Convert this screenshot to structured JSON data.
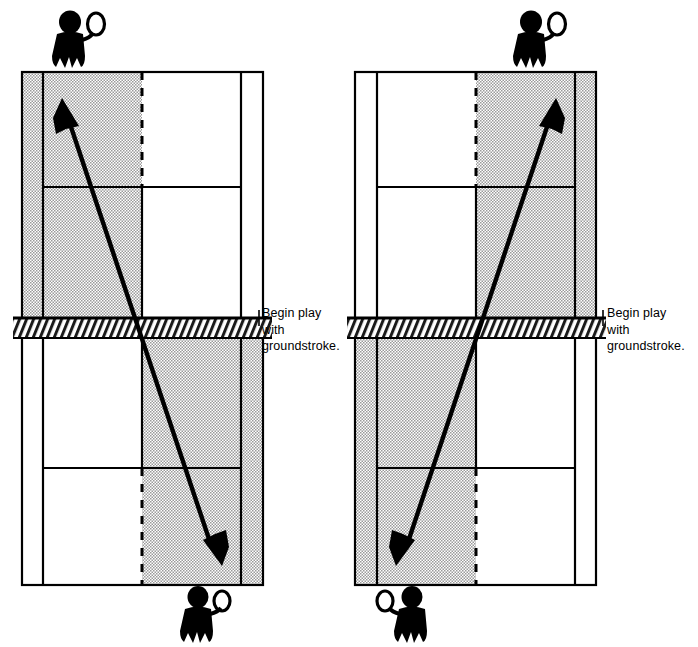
{
  "figure": {
    "type": "diagram",
    "background_color": "#ffffff",
    "ink_color": "#000000",
    "shade_color": "#d0d0d0"
  },
  "panels": [
    {
      "id": "left",
      "name": "crosscourt-drill",
      "caption": "Begin play\nwith\ngroundstroke.",
      "shaded_zone_top": "deuce-side-left-half",
      "shaded_zone_bottom": "ad-side-right-half",
      "players": [
        {
          "name": "player-top",
          "position": "top-left-of-baseline",
          "racquet_side": "right"
        },
        {
          "name": "player-bottom",
          "position": "bottom-center-right-of-baseline",
          "racquet_side": "right"
        }
      ],
      "ball_path": {
        "name": "crosscourt-rally-line",
        "from": "bottom-right-shaded-zone",
        "to": "top-left-shaded-zone",
        "arrowheads": [
          "top-end",
          "bottom-end"
        ],
        "crosses_net_at": "center"
      }
    },
    {
      "id": "right",
      "name": "down-the-line-drill",
      "caption": "Begin play\nwith\ngroundstroke.",
      "shaded_zone_top": "right-half",
      "shaded_zone_bottom": "left-half",
      "players": [
        {
          "name": "player-top",
          "position": "top-right-of-baseline",
          "racquet_side": "right"
        },
        {
          "name": "player-bottom",
          "position": "bottom-left-of-baseline",
          "racquet_side": "left"
        }
      ],
      "ball_path": {
        "name": "crosscourt-rally-line",
        "from": "bottom-left-shaded-zone",
        "to": "top-right-shaded-zone",
        "arrowheads": [
          "top-end",
          "bottom-end"
        ],
        "crosses_net_at": "center"
      }
    }
  ],
  "court": {
    "lines": [
      "baseline-top",
      "baseline-bottom",
      "sideline-left",
      "sideline-right",
      "doubles-alley-left",
      "doubles-alley-right",
      "service-line-top",
      "service-line-bottom",
      "center-service-line-dashed",
      "net"
    ],
    "net_style": "hatched-band"
  }
}
